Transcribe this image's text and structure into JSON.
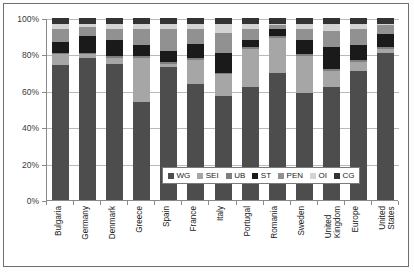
{
  "chart_data": {
    "type": "bar",
    "subtype": "stacked-percentage",
    "title": "",
    "xlabel": "",
    "ylabel": "",
    "ylim": [
      0,
      100
    ],
    "yticks": [
      "0%",
      "20%",
      "40%",
      "60%",
      "80%",
      "100%"
    ],
    "ytick_values": [
      0,
      20,
      40,
      60,
      80,
      100
    ],
    "grid": true,
    "legend_position": "inside-bottom-center",
    "categories": [
      "Bulgaria",
      "Germany",
      "Denmark",
      "Greece",
      "Spain",
      "France",
      "Italy",
      "Portugal",
      "Romania",
      "Sweden",
      "United Kingdom",
      "Europe",
      "United States"
    ],
    "series": [
      {
        "name": "WG",
        "color": "#4d4d4d",
        "values": [
          74,
          78,
          75,
          54,
          73,
          64,
          57,
          62,
          70,
          59,
          62,
          71,
          81
        ]
      },
      {
        "name": "SEI",
        "color": "#a6a6a6",
        "values": [
          6,
          2,
          3,
          24,
          2,
          13,
          12,
          21,
          19,
          20,
          9,
          5,
          2
        ]
      },
      {
        "name": "UB",
        "color": "#7f7f7f",
        "values": [
          1,
          1,
          1,
          1,
          1,
          1,
          1,
          1,
          1,
          1,
          1,
          1,
          1
        ]
      },
      {
        "name": "ST",
        "color": "#1a1a1a",
        "values": [
          6,
          9,
          9,
          6,
          6,
          8,
          11,
          4,
          4,
          8,
          12,
          8,
          7
        ]
      },
      {
        "name": "PEN",
        "color": "#919191",
        "values": [
          7,
          5,
          6,
          9,
          12,
          8,
          11,
          6,
          2,
          6,
          9,
          9,
          5
        ]
      },
      {
        "name": "OI",
        "color": "#d4d4d4",
        "values": [
          3,
          2,
          3,
          3,
          3,
          3,
          5,
          3,
          1,
          3,
          4,
          3,
          1
        ]
      },
      {
        "name": "CG",
        "color": "#333333",
        "values": [
          3,
          3,
          3,
          3,
          3,
          3,
          3,
          3,
          3,
          3,
          3,
          3,
          3
        ]
      }
    ]
  },
  "legend": {
    "items": [
      {
        "label": "WG",
        "color": "#4d4d4d"
      },
      {
        "label": "SEI",
        "color": "#a6a6a6"
      },
      {
        "label": "UB",
        "color": "#7f7f7f"
      },
      {
        "label": "ST",
        "color": "#1a1a1a"
      },
      {
        "label": "PEN",
        "color": "#919191"
      },
      {
        "label": "OI",
        "color": "#d4d4d4"
      },
      {
        "label": "CG",
        "color": "#333333"
      }
    ]
  }
}
